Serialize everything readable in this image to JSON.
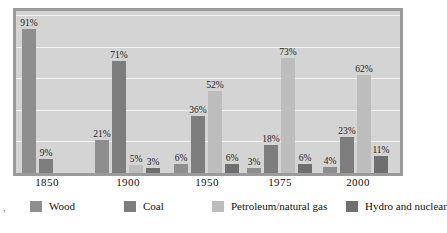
{
  "chart_data": {
    "type": "bar",
    "title": "",
    "subtitle": "",
    "xlabel": "",
    "ylabel": "",
    "ylim": [
      0,
      100
    ],
    "grid": true,
    "gridlines_percent": [
      20,
      40,
      60,
      80,
      100
    ],
    "legend_position": "bottom",
    "categories": [
      "1850",
      "1900",
      "1950",
      "1975",
      "2000"
    ],
    "series": [
      {
        "name": "Wood",
        "color": "#8e8e8e",
        "values": [
          91,
          21,
          6,
          3,
          4
        ],
        "labels": [
          "91%",
          "21%",
          "6%",
          "3%",
          "4%"
        ]
      },
      {
        "name": "Coal",
        "color": "#7d7d7d",
        "values": [
          9,
          71,
          36,
          18,
          23
        ],
        "labels": [
          "9%",
          "71%",
          "36%",
          "18%",
          "23%"
        ]
      },
      {
        "name": "Petroleum/natural gas",
        "color": "#bdbdbd",
        "values": [
          null,
          5,
          52,
          73,
          62
        ],
        "labels": [
          "",
          "5%",
          "52%",
          "73%",
          "62%"
        ]
      },
      {
        "name": "Hydro and nuclear",
        "color": "#6f6f6f",
        "values": [
          null,
          3,
          6,
          6,
          11
        ],
        "labels": [
          "",
          "3%",
          "6%",
          "6%",
          "11%"
        ]
      }
    ],
    "value_suffix": "%"
  },
  "legend": {
    "items": [
      {
        "label": "Wood",
        "color": "#8e8e8e"
      },
      {
        "label": "Coal",
        "color": "#7d7d7d"
      },
      {
        "label": "Petroleum/natural gas",
        "color": "#bdbdbd"
      },
      {
        "label": "Hydro and nuclear",
        "color": "#6f6f6f"
      }
    ]
  },
  "axis": {
    "x_ticks": [
      "1850",
      "1900",
      "1950",
      "1975",
      "2000"
    ]
  },
  "colors": {
    "plot_background": "#d4d4d4",
    "frame": "#9a9a9a",
    "gridline": "#f2f2f2",
    "text": "#111111",
    "page_background": "#ffffff"
  },
  "marks": {
    "stray_mark": ","
  }
}
